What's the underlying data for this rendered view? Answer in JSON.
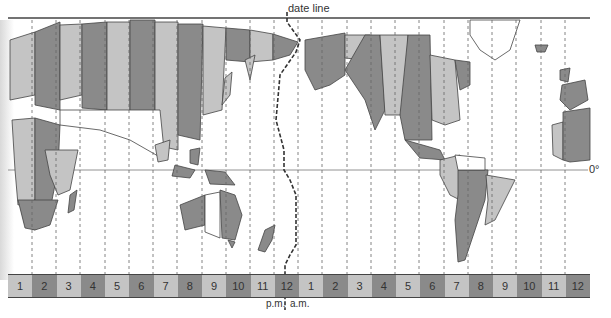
{
  "labels": {
    "date_line": "date line",
    "equator": "0°",
    "pm": "p.m.",
    "am": "a.m."
  },
  "colors": {
    "light_zone": "#c4c4c4",
    "dark_zone": "#8a8a8a",
    "ocean": "#ffffff",
    "line": "#555555"
  },
  "time_strip": {
    "pm_hours": [
      "1",
      "2",
      "3",
      "4",
      "5",
      "6",
      "7",
      "8",
      "9",
      "10",
      "11",
      "12"
    ],
    "am_hours": [
      "1",
      "2",
      "3",
      "4",
      "5",
      "6",
      "7",
      "8",
      "9",
      "10",
      "11",
      "12"
    ],
    "shades": [
      "light",
      "dark",
      "light",
      "dark",
      "light",
      "dark",
      "light",
      "dark",
      "light",
      "dark",
      "light",
      "dark",
      "light",
      "dark",
      "light",
      "dark",
      "light",
      "dark",
      "light",
      "dark",
      "light",
      "dark",
      "light",
      "dark"
    ]
  }
}
